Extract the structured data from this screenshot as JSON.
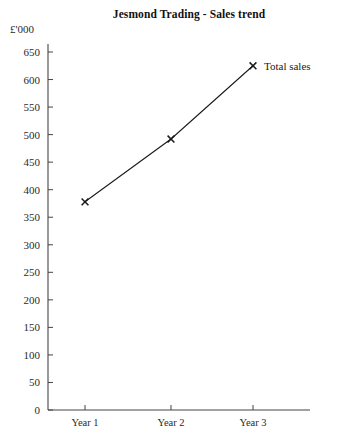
{
  "chart_data": {
    "type": "line",
    "title": "Jesmond Trading - Sales trend",
    "xlabel": "",
    "ylabel": "£'000",
    "unit_label": "£'000",
    "categories": [
      "Year 1",
      "Year 2",
      "Year 3"
    ],
    "series": [
      {
        "name": "Total sales",
        "values": [
          378,
          492,
          625
        ],
        "marker": "x",
        "color": "#1a1a1a"
      }
    ],
    "ylim": [
      0,
      650
    ],
    "ytick_step": 50,
    "yticks": [
      0,
      50,
      100,
      150,
      200,
      250,
      300,
      350,
      400,
      450,
      500,
      550,
      600,
      650
    ],
    "ytick_labels": [
      "0",
      "50",
      "100",
      "150",
      "200",
      "250",
      "300",
      "350",
      "400",
      "450",
      "500",
      "550",
      "600",
      "650"
    ],
    "grid": false,
    "legend_position": "inline-right",
    "annotations": [
      {
        "text": "Total sales",
        "attached_to_point_index": 2
      }
    ]
  },
  "geometry": {
    "origin_x": 48,
    "origin_y": 410,
    "y_top_px": 52,
    "x_right_px": 310,
    "x_positions": [
      85,
      171,
      253
    ],
    "axis_color": "#444444"
  }
}
